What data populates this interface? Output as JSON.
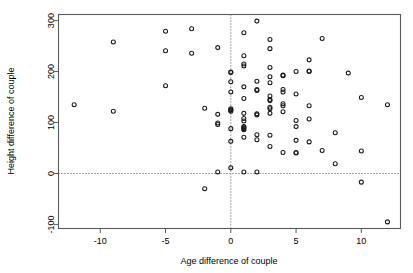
{
  "chart_data": {
    "type": "scatter",
    "title": "",
    "xlabel": "Age difference of couple",
    "ylabel": "Height difference of couple",
    "xlim": [
      -13.2,
      13.0
    ],
    "ylim": [
      -108,
      312
    ],
    "xticks": [
      -10,
      -5,
      0,
      5,
      10
    ],
    "xticklabels": [
      "-10",
      "-5",
      "0",
      "5",
      "10"
    ],
    "yticks": [
      -100,
      0,
      100,
      200,
      300
    ],
    "yticklabels": [
      "-100",
      "0",
      "100",
      "200",
      "300"
    ],
    "grid": false,
    "legend": null,
    "marker": "open-circle",
    "marker_color": "#1a1a1a",
    "reference_lines": [
      {
        "orientation": "horizontal",
        "value": 0,
        "style": "dotted"
      },
      {
        "orientation": "vertical",
        "value": 0,
        "style": "dotted"
      }
    ],
    "points": [
      [
        -12,
        135
      ],
      [
        -9,
        258
      ],
      [
        -9,
        122
      ],
      [
        -5,
        279
      ],
      [
        -5,
        241
      ],
      [
        -5,
        172
      ],
      [
        -3,
        284
      ],
      [
        -3,
        236
      ],
      [
        -2,
        128
      ],
      [
        -2,
        -30
      ],
      [
        -1,
        247
      ],
      [
        -1,
        116
      ],
      [
        -1,
        99
      ],
      [
        -1,
        96
      ],
      [
        -1,
        3
      ],
      [
        0,
        199
      ],
      [
        0,
        198
      ],
      [
        0,
        180
      ],
      [
        0,
        160
      ],
      [
        0,
        127
      ],
      [
        0,
        125
      ],
      [
        0,
        124
      ],
      [
        0,
        122
      ],
      [
        0,
        88
      ],
      [
        0,
        63
      ],
      [
        0,
        11
      ],
      [
        1,
        276
      ],
      [
        1,
        231
      ],
      [
        1,
        215
      ],
      [
        1,
        211
      ],
      [
        1,
        170
      ],
      [
        1,
        147
      ],
      [
        1,
        118
      ],
      [
        1,
        108
      ],
      [
        1,
        103
      ],
      [
        1,
        92
      ],
      [
        1,
        90
      ],
      [
        1,
        88
      ],
      [
        1,
        86
      ],
      [
        1,
        71
      ],
      [
        1,
        3
      ],
      [
        2,
        299
      ],
      [
        2,
        181
      ],
      [
        2,
        165
      ],
      [
        2,
        163
      ],
      [
        2,
        117
      ],
      [
        2,
        115
      ],
      [
        2,
        76
      ],
      [
        2,
        66
      ],
      [
        2,
        3
      ],
      [
        3,
        263
      ],
      [
        3,
        245
      ],
      [
        3,
        208
      ],
      [
        3,
        190
      ],
      [
        3,
        178
      ],
      [
        3,
        152
      ],
      [
        3,
        145
      ],
      [
        3,
        143
      ],
      [
        3,
        130
      ],
      [
        3,
        127
      ],
      [
        3,
        118
      ],
      [
        3,
        75
      ],
      [
        3,
        53
      ],
      [
        4,
        193
      ],
      [
        4,
        192
      ],
      [
        4,
        165
      ],
      [
        4,
        160
      ],
      [
        4,
        137
      ],
      [
        4,
        133
      ],
      [
        4,
        121
      ],
      [
        4,
        41
      ],
      [
        5,
        200
      ],
      [
        5,
        156
      ],
      [
        5,
        104
      ],
      [
        5,
        92
      ],
      [
        5,
        65
      ],
      [
        5,
        41
      ],
      [
        5,
        40
      ],
      [
        6,
        223
      ],
      [
        6,
        201
      ],
      [
        6,
        200
      ],
      [
        6,
        133
      ],
      [
        6,
        107
      ],
      [
        6,
        62
      ],
      [
        7,
        265
      ],
      [
        7,
        45
      ],
      [
        8,
        80
      ],
      [
        8,
        19
      ],
      [
        9,
        197
      ],
      [
        10,
        149
      ],
      [
        10,
        44
      ],
      [
        10,
        -17
      ],
      [
        12,
        135
      ],
      [
        12,
        -95
      ]
    ]
  }
}
